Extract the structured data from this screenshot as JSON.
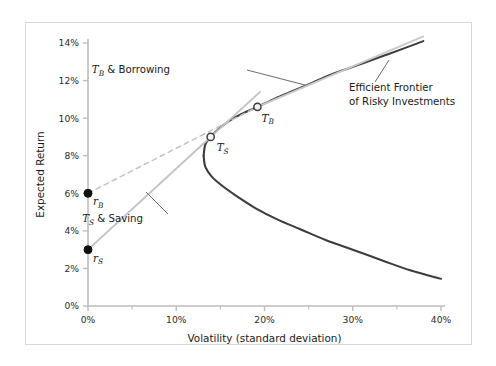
{
  "chart_data": {
    "type": "line",
    "title": "",
    "xlabel": "Volatility (standard deviation)",
    "ylabel": "Expected Return",
    "xlim": [
      0,
      40
    ],
    "ylim": [
      0,
      14
    ],
    "grid": false,
    "legend_position": "none",
    "x_ticks": [
      "0%",
      "10%",
      "20%",
      "30%",
      "40%"
    ],
    "x_tick_values": [
      0,
      10,
      20,
      30,
      40
    ],
    "x_minor_tick_values": [
      5,
      15,
      25,
      35
    ],
    "y_ticks": [
      "0%",
      "2%",
      "4%",
      "6%",
      "8%",
      "10%",
      "12%",
      "14%"
    ],
    "y_tick_values": [
      0,
      2,
      4,
      6,
      8,
      10,
      12,
      14
    ],
    "series": [
      {
        "name": "Efficient Frontier of Risky Investments",
        "style": "solid",
        "color": "#3d3d3d",
        "width": 2.1,
        "comment": "hyperbola opening rightward; upper branch from vertex to top right, lower branch descending to bottom right",
        "points_upper": [
          [
            13.1,
            8.0
          ],
          [
            13.3,
            8.6
          ],
          [
            13.9,
            9.0
          ],
          [
            15.0,
            9.5
          ],
          [
            16.5,
            10.0
          ],
          [
            18.0,
            10.35
          ],
          [
            19.2,
            10.6
          ],
          [
            21.0,
            11.0
          ],
          [
            23.0,
            11.4
          ],
          [
            25.5,
            11.9
          ],
          [
            28.0,
            12.4
          ],
          [
            31.0,
            12.9
          ],
          [
            34.0,
            13.4
          ],
          [
            38.0,
            14.1
          ]
        ],
        "points_lower": [
          [
            13.1,
            8.0
          ],
          [
            13.3,
            7.4
          ],
          [
            14.0,
            6.9
          ],
          [
            15.2,
            6.4
          ],
          [
            17.0,
            5.8
          ],
          [
            19.0,
            5.2
          ],
          [
            21.5,
            4.6
          ],
          [
            24.0,
            4.1
          ],
          [
            27.0,
            3.5
          ],
          [
            30.0,
            3.0
          ],
          [
            33.5,
            2.4
          ],
          [
            36.5,
            1.9
          ],
          [
            40.0,
            1.45
          ]
        ]
      },
      {
        "name": "T_S & Saving",
        "style": "solid",
        "color": "#c3c3c3",
        "width": 1.9,
        "comment": "capital allocation line from risk-free saving rate through tangency portfolio T_S",
        "points": [
          [
            0,
            3.0
          ],
          [
            13.9,
            9.0
          ],
          [
            19.5,
            11.4
          ]
        ]
      },
      {
        "name": "T_B & Borrowing (dashed segment)",
        "style": "dashed",
        "color": "#c3c3c3",
        "width": 1.5,
        "comment": "dashed from borrowing rate r_B up to tangency portfolio T_B",
        "points": [
          [
            0,
            6.0
          ],
          [
            19.2,
            10.6
          ]
        ]
      },
      {
        "name": "T_B & Borrowing (solid segment)",
        "style": "solid",
        "color": "#cacaca",
        "width": 2.0,
        "comment": "solid continuation beyond T_B, lies just above the efficient frontier",
        "points": [
          [
            19.2,
            10.6
          ],
          [
            38.0,
            14.35
          ]
        ]
      }
    ],
    "markers": [
      {
        "name": "r_B",
        "label": "r",
        "sub": "B",
        "x": 0,
        "y": 6.0,
        "fill": "filled",
        "color": "#111111",
        "label_dx": 5,
        "label_dy": 12
      },
      {
        "name": "r_S",
        "label": "r",
        "sub": "S",
        "x": 0,
        "y": 3.0,
        "fill": "filled",
        "color": "#111111",
        "label_dx": 5,
        "label_dy": 12
      },
      {
        "name": "T_S",
        "label": "T",
        "sub": "S",
        "x": 13.9,
        "y": 9.0,
        "fill": "open",
        "color": "#3d3d3d",
        "label_dx": 6,
        "label_dy": 14
      },
      {
        "name": "T_B",
        "label": "T",
        "sub": "B",
        "x": 19.2,
        "y": 10.6,
        "fill": "open",
        "color": "#3d3d3d",
        "label_dx": 4,
        "label_dy": 15
      }
    ],
    "annotations": [
      {
        "name": "borrowing-annotation",
        "lines": [
          "T_B & Borrowing"
        ],
        "text_prefix": "T",
        "text_sub": "B",
        "text_suffix": " & Borrowing",
        "text_x": 170,
        "text_y": 73,
        "leader": [
          [
            247,
            70
          ],
          [
            305,
            85
          ]
        ]
      },
      {
        "name": "efficient-frontier-annotation",
        "lines": [
          "Efficient Frontier",
          "of Risky Investments"
        ],
        "text_x": 349,
        "text_y": 91,
        "leader": [
          [
            375,
            82
          ],
          [
            389,
            60
          ]
        ]
      },
      {
        "name": "saving-annotation",
        "text_prefix": "T",
        "text_sub": "S",
        "text_suffix": " & Saving",
        "text_x": 143,
        "text_y": 222,
        "leader": [
          [
            168,
            214
          ],
          [
            146,
            192
          ]
        ]
      }
    ],
    "colors": {
      "frontier": "#3d3d3d",
      "saving_line": "#c3c3c3",
      "borrowing_line": "#c8c8c8",
      "axis": "#bdbdbd",
      "text": "#1a1a1a",
      "frame": "#d8d8d8",
      "marker_fill": "#111111",
      "marker_open_fill": "#f2f2f2"
    }
  }
}
